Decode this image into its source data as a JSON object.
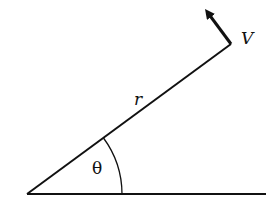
{
  "diagram": {
    "labels": {
      "velocity": "V",
      "radius": "r",
      "angle": "θ"
    },
    "colors": {
      "stroke": "#111111",
      "background": "#ffffff"
    },
    "geometry": {
      "origin": [
        27,
        194
      ],
      "baseline_end": [
        266,
        194
      ],
      "radius_end": [
        231,
        44
      ],
      "arrow_tip": [
        203,
        6
      ],
      "arc_radius": 95
    }
  }
}
